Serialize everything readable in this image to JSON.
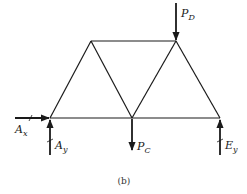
{
  "diagram": {
    "type": "truss-free-body-diagram",
    "caption": "(b)",
    "colors": {
      "member": "#1a1a1a",
      "arrow": "#1a1a1a",
      "background": "#ffffff"
    },
    "joints": {
      "A": {
        "x": 50,
        "y": 118
      },
      "B": {
        "x": 91,
        "y": 41
      },
      "C": {
        "x": 132,
        "y": 118
      },
      "D": {
        "x": 176,
        "y": 41
      },
      "E": {
        "x": 220,
        "y": 118
      }
    },
    "members": [
      [
        "A",
        "B"
      ],
      [
        "B",
        "C"
      ],
      [
        "C",
        "D"
      ],
      [
        "D",
        "E"
      ],
      [
        "B",
        "D"
      ],
      [
        "A",
        "C"
      ],
      [
        "C",
        "E"
      ]
    ],
    "forces": [
      {
        "id": "P_D",
        "main": "P",
        "sub": "D",
        "joint": "D",
        "direction": "down"
      },
      {
        "id": "P_C",
        "main": "P",
        "sub": "C",
        "joint": "C",
        "direction": "down"
      },
      {
        "id": "A_x",
        "main": "A",
        "sub": "x",
        "joint": "A",
        "direction": "right"
      },
      {
        "id": "A_y",
        "main": "A",
        "sub": "y",
        "joint": "A",
        "direction": "up"
      },
      {
        "id": "E_y",
        "main": "E",
        "sub": "y",
        "joint": "E",
        "direction": "up"
      }
    ],
    "labels": {
      "P_D": {
        "main": "P",
        "sub": "D"
      },
      "P_C": {
        "main": "P",
        "sub": "C"
      },
      "A_x": {
        "main": "A",
        "sub": "x"
      },
      "A_y": {
        "main": "A",
        "sub": "y"
      },
      "E_y": {
        "main": "E",
        "sub": "y"
      }
    }
  }
}
